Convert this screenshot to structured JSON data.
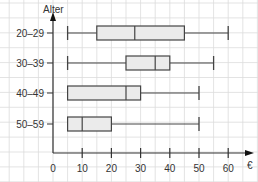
{
  "chart_data": {
    "type": "boxplot",
    "orientation": "horizontal",
    "title": "",
    "xlabel": "€",
    "ylabel": "Alter",
    "xlim": [
      0,
      70
    ],
    "x_ticks": [
      0,
      10,
      20,
      30,
      40,
      50,
      60
    ],
    "x_tick_labels": [
      "0",
      "10",
      "20",
      "30",
      "40",
      "50",
      "60"
    ],
    "grid": true,
    "categories": [
      "20–29",
      "30–39",
      "40–49",
      "50–59"
    ],
    "series": [
      {
        "name": "20–29",
        "min": 5,
        "q1": 15,
        "median": 28,
        "q3": 45,
        "max": 60
      },
      {
        "name": "30–39",
        "min": 5,
        "q1": 25,
        "median": 35,
        "q3": 40,
        "max": 55
      },
      {
        "name": "40–49",
        "min": 5,
        "q1": 5,
        "median": 25,
        "q3": 30,
        "max": 50
      },
      {
        "name": "50–59",
        "min": 5,
        "q1": 5,
        "median": 10,
        "q3": 20,
        "max": 50
      }
    ],
    "colors": {
      "box_fill": "#ebebeb",
      "box_stroke": "#444444",
      "axis": "#333333",
      "grid": "#dcdcdc"
    }
  }
}
